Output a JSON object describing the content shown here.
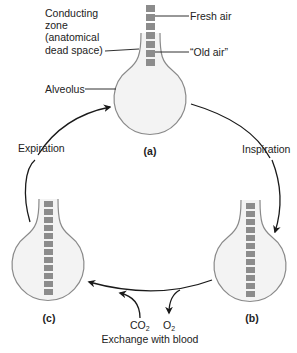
{
  "colors": {
    "alveolus_fill": "#f3f3f3",
    "alveolus_stroke": "#8a8a8a",
    "air_block": "#8c8c8c",
    "line": "#1a1a1a",
    "text": "#222222"
  },
  "labels": {
    "conducting_zone": [
      "Conducting",
      "zone",
      "(anatomical",
      "dead space)"
    ],
    "fresh_air": "Fresh air",
    "old_air": "“Old air”",
    "alveolus": "Alveolus",
    "expiration": "Expiration",
    "inspiration": "Inspiration",
    "exchange": "Exchange with blood",
    "co2": "CO",
    "co2_sub": "2",
    "o2": "O",
    "o2_sub": "2"
  },
  "panels": [
    {
      "id": "a",
      "label": "(a)",
      "air_blocks": 7
    },
    {
      "id": "b",
      "label": "(b)",
      "air_blocks": 12
    },
    {
      "id": "c",
      "label": "(c)",
      "air_blocks": 12
    }
  ]
}
